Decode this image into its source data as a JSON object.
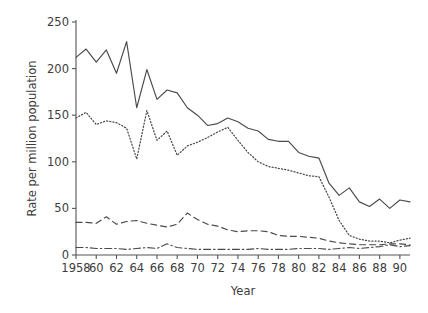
{
  "chart_data": {
    "type": "line",
    "title": "",
    "xlabel": "Year",
    "ylabel": "Rate per million population",
    "xlim": [
      1958,
      1991
    ],
    "ylim": [
      0,
      250
    ],
    "grid": false,
    "legend": "none",
    "x_tick_labels": [
      "1958",
      "60",
      "62",
      "64",
      "66",
      "68",
      "70",
      "72",
      "74",
      "76",
      "78",
      "80",
      "82",
      "84",
      "86",
      "88",
      "90"
    ],
    "x_tick_values": [
      1958,
      1960,
      1962,
      1964,
      1966,
      1968,
      1970,
      1972,
      1974,
      1976,
      1978,
      1980,
      1982,
      1984,
      1986,
      1988,
      1990
    ],
    "y_tick_labels": [
      "0",
      "50",
      "100",
      "150",
      "200",
      "250"
    ],
    "y_tick_values": [
      0,
      50,
      100,
      150,
      200,
      250
    ],
    "x": [
      1958,
      1959,
      1960,
      1961,
      1962,
      1963,
      1964,
      1965,
      1966,
      1967,
      1968,
      1969,
      1970,
      1971,
      1972,
      1973,
      1974,
      1975,
      1976,
      1977,
      1978,
      1979,
      1980,
      1981,
      1982,
      1983,
      1984,
      1985,
      1986,
      1987,
      1988,
      1989,
      1990,
      1991
    ],
    "series": [
      {
        "name": "series-solid",
        "style": "solid",
        "values": [
          212,
          221,
          207,
          220,
          195,
          229,
          158,
          199,
          167,
          177,
          174,
          158,
          150,
          139,
          141,
          147,
          143,
          136,
          133,
          124,
          122,
          122,
          110,
          106,
          104,
          77,
          64,
          72,
          57,
          52,
          60,
          50,
          59,
          57
        ]
      },
      {
        "name": "series-dotted",
        "style": "dotted",
        "values": [
          147,
          153,
          140,
          144,
          142,
          136,
          103,
          155,
          123,
          133,
          107,
          117,
          121,
          126,
          132,
          137,
          123,
          110,
          100,
          95,
          93,
          91,
          88,
          85,
          84,
          62,
          37,
          21,
          17,
          15,
          15,
          13,
          16,
          18
        ]
      },
      {
        "name": "series-dashed",
        "style": "dashed",
        "values": [
          35,
          35,
          34,
          41,
          33,
          36,
          37,
          34,
          32,
          30,
          33,
          45,
          38,
          33,
          31,
          27,
          25,
          26,
          26,
          25,
          21,
          20,
          20,
          19,
          18,
          15,
          13,
          12,
          11,
          11,
          11,
          12,
          12,
          11
        ]
      },
      {
        "name": "series-dashdot",
        "style": "dashdot",
        "values": [
          8,
          8,
          7,
          7,
          7,
          6,
          7,
          8,
          7,
          12,
          8,
          7,
          6,
          6,
          6,
          6,
          6,
          6,
          7,
          6,
          6,
          6,
          7,
          7,
          7,
          6,
          7,
          8,
          7,
          8,
          9,
          11,
          9,
          10
        ]
      }
    ]
  }
}
